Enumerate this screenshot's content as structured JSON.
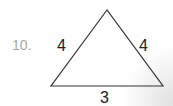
{
  "problem": {
    "number": "10.",
    "figure": "triangle",
    "sides": {
      "left": "4",
      "right": "4",
      "base": "3"
    }
  },
  "colors": {
    "stroke": "#333333",
    "number": "#a8a8a8",
    "labels": "#222222"
  }
}
